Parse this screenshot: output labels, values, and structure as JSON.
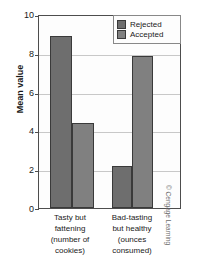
{
  "chart_data": {
    "type": "bar",
    "title": "",
    "xlabel": "",
    "ylabel": "Mean value",
    "ylim": [
      0,
      10
    ],
    "yticks": [
      10,
      8,
      6,
      4,
      2,
      0
    ],
    "grid": true,
    "legend_position": "top-right",
    "categories": [
      "Tasty but fattening (number of cookies)",
      "Bad-tasting but healthy (ounces consumed)"
    ],
    "category_lines": [
      [
        "Tasty but",
        "fattening",
        "(number of",
        "cookies)"
      ],
      [
        "Bad-tasting",
        "but healthy",
        "(ounces",
        "consumed)"
      ]
    ],
    "series": [
      {
        "name": "Rejected",
        "color": "#6e6e6e",
        "values": [
          8.9,
          2.2
        ]
      },
      {
        "name": "Accepted",
        "color": "#808080",
        "values": [
          4.4,
          7.9
        ]
      }
    ]
  },
  "legend": {
    "items": [
      {
        "label": "Rejected"
      },
      {
        "label": "Accepted"
      }
    ]
  },
  "credit": {
    "text": "© Cengage Learning"
  }
}
